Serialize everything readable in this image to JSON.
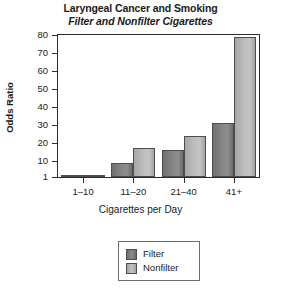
{
  "chart_data": {
    "type": "bar",
    "title": "Laryngeal Cancer and Smoking",
    "subtitle": "Filter and Nonfilter Cigarettes",
    "xlabel": "Cigarettes per Day",
    "ylabel": "Odds Ratio",
    "categories": [
      "1–10",
      "11–20",
      "21–40",
      "41+"
    ],
    "series": [
      {
        "name": "Filter",
        "values": [
          1.5,
          9,
          16,
          31
        ],
        "color": "#8b8b8b"
      },
      {
        "name": "Nonfilter",
        "values": [
          2,
          17,
          24,
          79
        ],
        "color": "#bdbdbd"
      }
    ],
    "ylim": [
      1,
      80
    ],
    "yticks": [
      1,
      10,
      20,
      30,
      40,
      50,
      60,
      70,
      80
    ],
    "ytick_labels": [
      "1",
      "10",
      "20",
      "30",
      "40",
      "50",
      "60",
      "70",
      "80"
    ],
    "grid": false,
    "legend_position": "bottom-center",
    "legend_entries": [
      "Filter",
      "Nonfilter"
    ]
  }
}
